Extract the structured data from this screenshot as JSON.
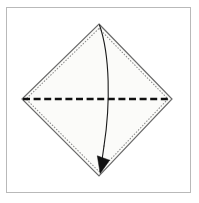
{
  "figure": {
    "title": "Origami step: valley fold square in half along horizontal diagonal",
    "caption": "",
    "frame": {
      "x": 6.5,
      "y": 7.5,
      "width": 184,
      "height": 185,
      "stroke": "#b9b9b9",
      "fill": "#ffffff",
      "stroke_width": 1
    },
    "paper": {
      "shape_name": "square-sheet-diamond-orientation",
      "points": "99,24 172,99 99,176 22,99",
      "fill": "#fbfbf9",
      "stroke": "#6b6b6b",
      "stroke_width": 1.2
    },
    "inner_edge": {
      "shape_name": "inner-dotted-edge",
      "points": "99,28.5 168,99 99,171.5 26,99",
      "stroke": "#8c8c8c",
      "stroke_width": 1.1,
      "dash": "0.6 2.4"
    },
    "fold_line": {
      "label": "valley-fold-line",
      "x1": 23,
      "y1": 99,
      "x2": 171,
      "y2": 99,
      "stroke": "#111111",
      "stroke_width": 2.6,
      "dash": "7 3.6"
    },
    "fold_arrow": {
      "label": "fold-direction-arrow",
      "path": "M 99.5 25 C 110 55, 110.5 104, 104 146",
      "stroke": "#1a1a1a",
      "stroke_width": 1.1,
      "head_points": "100.2,173.5 97.3,155.8 109.6,160.2",
      "head_fill": "#111111"
    },
    "colors": {
      "background": "#ffffff",
      "frame_border": "#b9b9b9",
      "paper_fill": "#fbfbf9",
      "paper_stroke": "#6b6b6b",
      "dotted_edge": "#8c8c8c",
      "fold_dash": "#111111",
      "arrow": "#111111"
    }
  }
}
